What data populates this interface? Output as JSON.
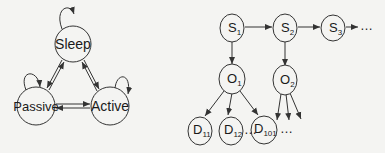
{
  "state_diagram": {
    "nodes": [
      {
        "id": "sleep",
        "label": "Sleep",
        "cx": 73,
        "cy": 44,
        "r": 18
      },
      {
        "id": "passive",
        "label": "Passive",
        "cx": 36,
        "cy": 106,
        "r": 19
      },
      {
        "id": "active",
        "label": "Active",
        "cx": 110,
        "cy": 106,
        "r": 19
      }
    ],
    "edges": [
      {
        "from": "sleep",
        "to": "sleep",
        "type": "self-loop"
      },
      {
        "from": "passive",
        "to": "passive",
        "type": "self-loop"
      },
      {
        "from": "active",
        "to": "active",
        "type": "self-loop"
      },
      {
        "from": "sleep",
        "to": "passive",
        "type": "bidirectional"
      },
      {
        "from": "sleep",
        "to": "active",
        "type": "bidirectional"
      },
      {
        "from": "passive",
        "to": "active",
        "type": "bidirectional"
      }
    ]
  },
  "hmm_diagram": {
    "states": [
      {
        "id": "s1",
        "base": "S",
        "sub": "1"
      },
      {
        "id": "s2",
        "base": "S",
        "sub": "2"
      },
      {
        "id": "s3",
        "base": "S",
        "sub": "3"
      }
    ],
    "state_ellipsis": "…",
    "observations": [
      {
        "id": "o1",
        "base": "O",
        "sub": "1"
      },
      {
        "id": "o2",
        "base": "O",
        "sub": "2"
      }
    ],
    "documents": [
      {
        "id": "d11",
        "base": "D",
        "sub": "11"
      },
      {
        "id": "d12",
        "base": "D",
        "sub": "12"
      },
      {
        "id": "d101",
        "base": "D",
        "sub": "101"
      }
    ],
    "doc_ellipsis": "…",
    "o2_ellipsis": "…"
  }
}
